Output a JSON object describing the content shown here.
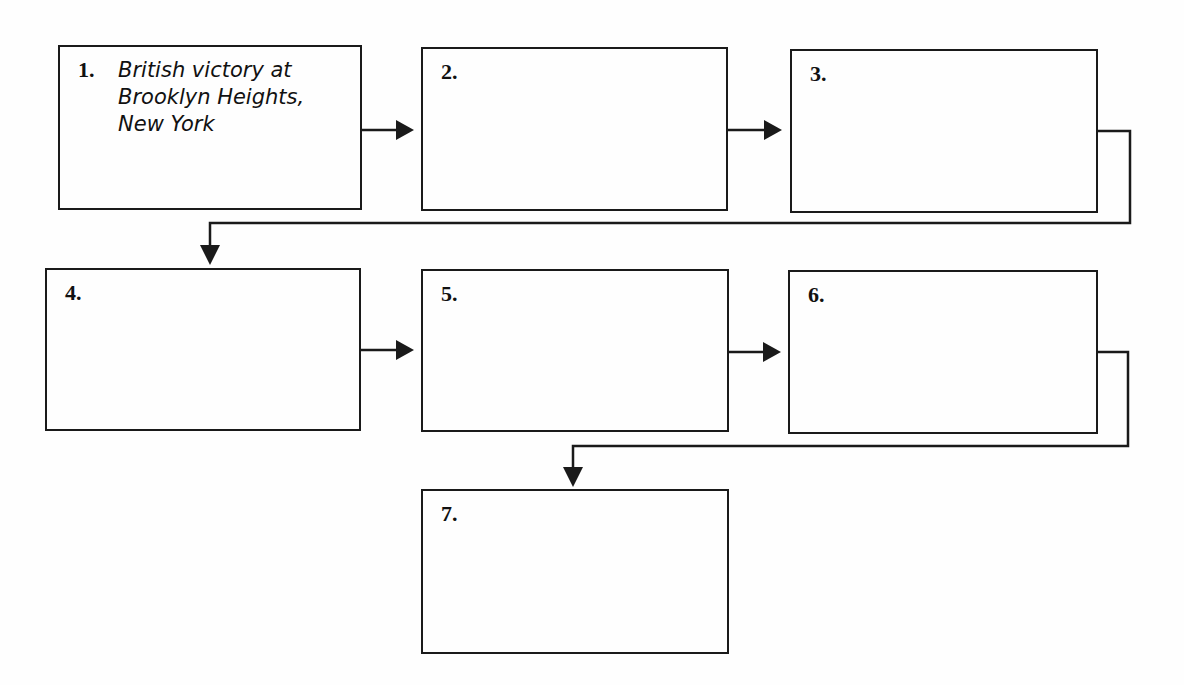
{
  "diagram": {
    "type": "sequence-flowchart",
    "boxes": [
      {
        "number": "1.",
        "text": "British victory at\nBrooklyn Heights,\nNew York"
      },
      {
        "number": "2.",
        "text": ""
      },
      {
        "number": "3.",
        "text": ""
      },
      {
        "number": "4.",
        "text": ""
      },
      {
        "number": "5.",
        "text": ""
      },
      {
        "number": "6.",
        "text": ""
      },
      {
        "number": "7.",
        "text": ""
      }
    ],
    "flow": [
      "1→2",
      "2→3",
      "3→4",
      "4→5",
      "5→6",
      "6→7"
    ],
    "line_color": "#1a1a1a"
  }
}
